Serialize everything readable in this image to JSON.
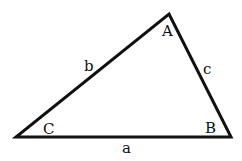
{
  "diagram": {
    "type": "triangle",
    "stroke_color": "#111111",
    "background": "#ffffff",
    "vertices": [
      {
        "name": "A",
        "x": 169,
        "y": 14,
        "label_x": 162,
        "label_y": 36
      },
      {
        "name": "B",
        "x": 231,
        "y": 137,
        "label_x": 205,
        "label_y": 133
      },
      {
        "name": "C",
        "x": 16,
        "y": 137,
        "label_x": 43,
        "label_y": 134
      }
    ],
    "sides": [
      {
        "name": "a",
        "between": "C-B",
        "label_x": 122,
        "label_y": 153
      },
      {
        "name": "b",
        "between": "C-A",
        "label_x": 84,
        "label_y": 71
      },
      {
        "name": "c",
        "between": "A-B",
        "label_x": 203,
        "label_y": 74
      }
    ]
  }
}
